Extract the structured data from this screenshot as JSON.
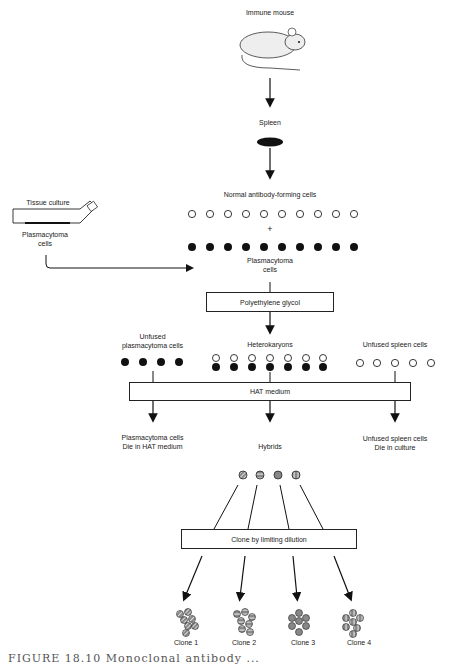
{
  "diagram": {
    "steps": {
      "immune_mouse": "Immune mouse",
      "spleen": "Spleen",
      "normal_cells": "Normal antibody-forming cells",
      "plus": "+",
      "plasmacytoma_cells_line1": "Plasmacytoma",
      "plasmacytoma_cells_line2": "cells",
      "tissue_culture": "Tissue culture",
      "tc_plasmacytoma_line1": "Plasmacytoma",
      "tc_plasmacytoma_line2": "cells",
      "peg_box": "Polyethylene glycol",
      "unfused_plasma_line1": "Unfused",
      "unfused_plasma_line2": "plasmacytoma cells",
      "heterokaryons": "Heterokaryons",
      "unfused_spleen": "Unfused spleen cells",
      "hat_box": "HAT medium",
      "plasma_die_line1": "Plasmacytoma cells",
      "plasma_die_line2": "Die in HAT medium",
      "hybrids": "Hybrids",
      "spleen_die_line1": "Unfused spleen cells",
      "spleen_die_line2": "Die in culture",
      "clone_box": "Clone by limiting dilution"
    },
    "clones": [
      {
        "label": "Clone 1",
        "pattern": "diagonal"
      },
      {
        "label": "Clone 2",
        "pattern": "horizontal"
      },
      {
        "label": "Clone 3",
        "pattern": "solid"
      },
      {
        "label": "Clone 4",
        "pattern": "vertical"
      }
    ],
    "counts": {
      "normal_cells": 10,
      "plasmacytoma_cells": 10,
      "unfused_plasma": 4,
      "heterokaryons": 7,
      "unfused_spleen": 5,
      "hybrids": 4
    },
    "caption": "FIGURE 18.10  Monoclonal antibody ..."
  }
}
